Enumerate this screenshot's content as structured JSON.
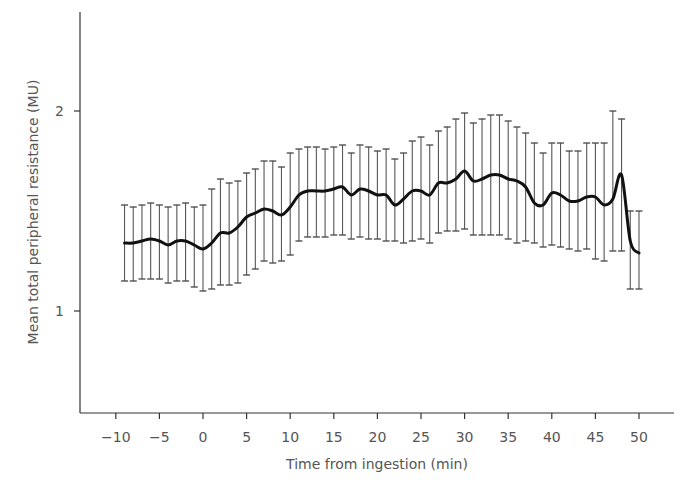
{
  "chart_data": {
    "type": "line",
    "title": "",
    "xlabel": "Time from ingestion (min)",
    "ylabel": "Mean total peripheral resistance (MU)",
    "xlim": [
      -12,
      54
    ],
    "ylim": [
      0.49,
      2.5
    ],
    "xticks": [
      -10,
      -5,
      0,
      5,
      10,
      15,
      20,
      25,
      30,
      35,
      40,
      45,
      50
    ],
    "xtick_labels": [
      "−10",
      "−5",
      "0",
      "5",
      "10",
      "15",
      "20",
      "25",
      "30",
      "35",
      "40",
      "45",
      "50"
    ],
    "yticks": [
      1,
      2
    ],
    "ytick_labels": [
      "1",
      "2"
    ],
    "grid": false,
    "legend": null,
    "error_bars": true,
    "series": [
      {
        "name": "Mean TPR",
        "x": [
          -9,
          -8,
          -7,
          -6,
          -5,
          -4,
          -3,
          -2,
          -1,
          0,
          1,
          2,
          3,
          4,
          5,
          6,
          7,
          8,
          9,
          10,
          11,
          12,
          13,
          14,
          15,
          16,
          17,
          18,
          19,
          20,
          21,
          22,
          23,
          24,
          25,
          26,
          27,
          28,
          29,
          30,
          31,
          32,
          33,
          34,
          35,
          36,
          37,
          38,
          39,
          40,
          41,
          42,
          43,
          44,
          45,
          46,
          47,
          48,
          49,
          50
        ],
        "mean": [
          1.34,
          1.34,
          1.35,
          1.36,
          1.35,
          1.33,
          1.35,
          1.35,
          1.33,
          1.31,
          1.34,
          1.39,
          1.39,
          1.42,
          1.47,
          1.49,
          1.51,
          1.5,
          1.48,
          1.52,
          1.58,
          1.6,
          1.6,
          1.6,
          1.61,
          1.62,
          1.58,
          1.61,
          1.6,
          1.58,
          1.58,
          1.53,
          1.56,
          1.6,
          1.6,
          1.58,
          1.64,
          1.64,
          1.66,
          1.7,
          1.65,
          1.66,
          1.68,
          1.68,
          1.66,
          1.65,
          1.62,
          1.54,
          1.53,
          1.59,
          1.58,
          1.55,
          1.55,
          1.57,
          1.57,
          1.53,
          1.56,
          1.68,
          1.35,
          1.29
        ],
        "upper": [
          1.53,
          1.52,
          1.53,
          1.54,
          1.53,
          1.52,
          1.53,
          1.54,
          1.52,
          1.53,
          1.61,
          1.66,
          1.64,
          1.65,
          1.69,
          1.71,
          1.75,
          1.75,
          1.72,
          1.79,
          1.81,
          1.82,
          1.82,
          1.81,
          1.82,
          1.83,
          1.79,
          1.83,
          1.82,
          1.8,
          1.81,
          1.76,
          1.79,
          1.85,
          1.87,
          1.83,
          1.9,
          1.92,
          1.96,
          1.99,
          1.94,
          1.96,
          1.98,
          1.98,
          1.95,
          1.92,
          1.89,
          1.84,
          1.79,
          1.84,
          1.84,
          1.8,
          1.8,
          1.84,
          1.84,
          1.84,
          2.0,
          1.96,
          1.5,
          1.5
        ],
        "lower": [
          1.15,
          1.15,
          1.16,
          1.16,
          1.16,
          1.14,
          1.15,
          1.15,
          1.12,
          1.1,
          1.11,
          1.13,
          1.13,
          1.14,
          1.18,
          1.21,
          1.25,
          1.24,
          1.25,
          1.28,
          1.35,
          1.37,
          1.37,
          1.37,
          1.38,
          1.38,
          1.36,
          1.37,
          1.36,
          1.36,
          1.35,
          1.35,
          1.34,
          1.35,
          1.36,
          1.34,
          1.39,
          1.4,
          1.4,
          1.41,
          1.38,
          1.38,
          1.38,
          1.38,
          1.36,
          1.34,
          1.35,
          1.34,
          1.32,
          1.33,
          1.32,
          1.31,
          1.3,
          1.31,
          1.26,
          1.25,
          1.3,
          1.3,
          1.11,
          1.11
        ]
      }
    ]
  },
  "caption": {
    "text": ""
  }
}
